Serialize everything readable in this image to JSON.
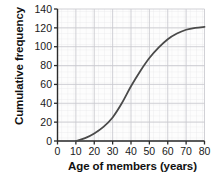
{
  "chart_data": {
    "type": "line",
    "title": "",
    "xlabel": "Age of members (years)",
    "ylabel": "Cumulative frequency",
    "xlim": [
      0,
      80
    ],
    "ylim": [
      0,
      140
    ],
    "xticks": [
      0,
      10,
      20,
      30,
      40,
      50,
      60,
      70,
      80
    ],
    "yticks": [
      0,
      20,
      40,
      60,
      80,
      100,
      120,
      140
    ],
    "grid": "minor and major gridlines shown",
    "legend": "none",
    "series": [
      {
        "name": "Cumulative frequency",
        "x": [
          10,
          15,
          20,
          25,
          30,
          35,
          40,
          45,
          50,
          55,
          60,
          65,
          70,
          75,
          80
        ],
        "values": [
          0,
          3,
          8,
          15,
          25,
          40,
          58,
          74,
          88,
          99,
          108,
          114,
          118,
          120,
          121
        ]
      }
    ],
    "line_color": "#4a4a4a",
    "curve_start_point": "(10, 0)",
    "curve_end_point": "(80, 121)"
  },
  "axes": {
    "y_title": "Cumulative frequency",
    "x_title": "Age of members (years)",
    "y_tick_labels": [
      "0",
      "20",
      "40",
      "60",
      "80",
      "100",
      "120",
      "140"
    ],
    "x_tick_labels": [
      "0",
      "10",
      "20",
      "30",
      "40",
      "50",
      "60",
      "70",
      "80"
    ]
  },
  "clipped_title_fragment": "g"
}
